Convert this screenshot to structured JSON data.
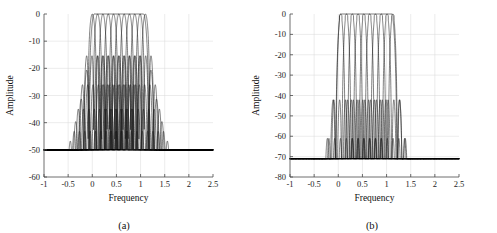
{
  "figure": {
    "width": 497,
    "height": 233,
    "background": "#ffffff",
    "line_color": "#1a1a1a",
    "axis_color": "#4a4a4a",
    "grid_color": "#d8d8d8"
  },
  "panels": [
    {
      "id": "panel-a",
      "caption": "(a)",
      "xlabel": "Frequency",
      "ylabel": "Amplitude"
    },
    {
      "id": "panel-b",
      "caption": "(b)",
      "xlabel": "Frequency",
      "ylabel": "Amplitude"
    }
  ],
  "chart_data": [
    {
      "type": "line",
      "title": "",
      "subtitle": "",
      "panel": "(a)",
      "xlabel": "Frequency",
      "ylabel": "Amplitude",
      "xlim": [
        -1,
        2.5
      ],
      "ylim": [
        -60,
        0
      ],
      "xticks": [
        -1,
        -0.5,
        0,
        0.5,
        1,
        1.5,
        2,
        2.5
      ],
      "xticklabels": [
        "-1",
        "-0.5",
        "0",
        "0.5",
        "1",
        "1.5",
        "2",
        "2.5"
      ],
      "yticks": [
        -60,
        -50,
        -40,
        -30,
        -20,
        -10,
        0
      ],
      "yticklabels": [
        "-60",
        "-50",
        "-40",
        "-30",
        "-20",
        "-10",
        "0"
      ],
      "grid": true,
      "legend": "none",
      "description": "Overlaid magnitude responses (dB) of a uniform filter bank; narrow channel filters with peak 0 dB and first sidelobes near -13 dB, plus a wide prototype envelope spanning the passband.",
      "series": [
        {
          "name": "channel-filters",
          "count": 11,
          "peak_db": 0,
          "first_sidelobe_db": -13,
          "centers": [
            0.0,
            0.11,
            0.22,
            0.33,
            0.44,
            0.55,
            0.66,
            0.77,
            0.88,
            0.99,
            1.1
          ],
          "mainlobe_halfwidth": 0.085,
          "sidelobe_decay_db_per_lobe": 6,
          "floor_db": -50
        },
        {
          "name": "prototype-wide-filter",
          "count": 1,
          "peak_db": 0,
          "first_sidelobe_db": -19,
          "centers": [
            0.55
          ],
          "mainlobe_halfwidth": 0.62,
          "sidelobe_decay_db_per_lobe": 4,
          "floor_db": -50
        }
      ]
    },
    {
      "type": "line",
      "title": "",
      "subtitle": "",
      "panel": "(b)",
      "xlabel": "Frequency",
      "ylabel": "Amplitude",
      "xlim": [
        -1,
        2.5
      ],
      "ylim": [
        -80,
        0
      ],
      "xticks": [
        -1,
        -0.5,
        0,
        0.5,
        1,
        1.5,
        2,
        2.5
      ],
      "xticklabels": [
        "-1",
        "-0.5",
        "0",
        "0.5",
        "1",
        "1.5",
        "2",
        "2.5"
      ],
      "yticks": [
        -80,
        -70,
        -60,
        -50,
        -40,
        -30,
        -20,
        -10,
        0
      ],
      "yticklabels": [
        "-80",
        "-70",
        "-60",
        "-50",
        "-40",
        "-30",
        "-20",
        "-10",
        "0"
      ],
      "grid": true,
      "legend": "none",
      "description": "Overlaid magnitude responses (dB) of a windowed uniform filter bank; narrow channel filters with flat 0 dB peaks, first sidelobes near -40 dB and a stopband floor near -71 dB, plus a wide flat-top prototype envelope.",
      "series": [
        {
          "name": "channel-filters",
          "count": 10,
          "peak_db": 0,
          "first_sidelobe_db": -40,
          "centers": [
            0.05,
            0.17,
            0.29,
            0.41,
            0.53,
            0.65,
            0.77,
            0.89,
            1.01,
            1.13
          ],
          "mainlobe_halfwidth": 0.1,
          "sidelobe_decay_db_per_lobe": 5,
          "floor_db": -71
        },
        {
          "name": "prototype-wide-filter",
          "count": 1,
          "peak_db": 0,
          "first_sidelobe_db": -40,
          "centers": [
            0.58
          ],
          "mainlobe_halfwidth": 0.64,
          "sidelobe_decay_db_per_lobe": 5,
          "floor_db": -71
        }
      ]
    }
  ]
}
